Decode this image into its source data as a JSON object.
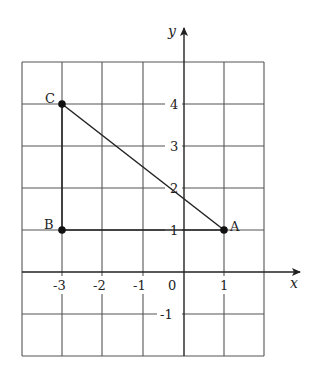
{
  "diagram": {
    "type": "coordinate-grid-triangle",
    "axes": {
      "x_label": "x",
      "y_label": "y",
      "x_ticks": [
        "-3",
        "-2",
        "-1",
        "0",
        "1"
      ],
      "y_ticks": [
        "4",
        "3",
        "2",
        "1",
        "-1"
      ]
    },
    "grid": {
      "x_range": [
        -4,
        2
      ],
      "y_range": [
        -2,
        5
      ]
    },
    "points": [
      {
        "label": "A",
        "x": 1,
        "y": 1
      },
      {
        "label": "B",
        "x": -3,
        "y": 1
      },
      {
        "label": "C",
        "x": -3,
        "y": 4
      }
    ],
    "segments": [
      [
        "A",
        "B"
      ],
      [
        "B",
        "C"
      ],
      [
        "C",
        "A"
      ]
    ]
  }
}
